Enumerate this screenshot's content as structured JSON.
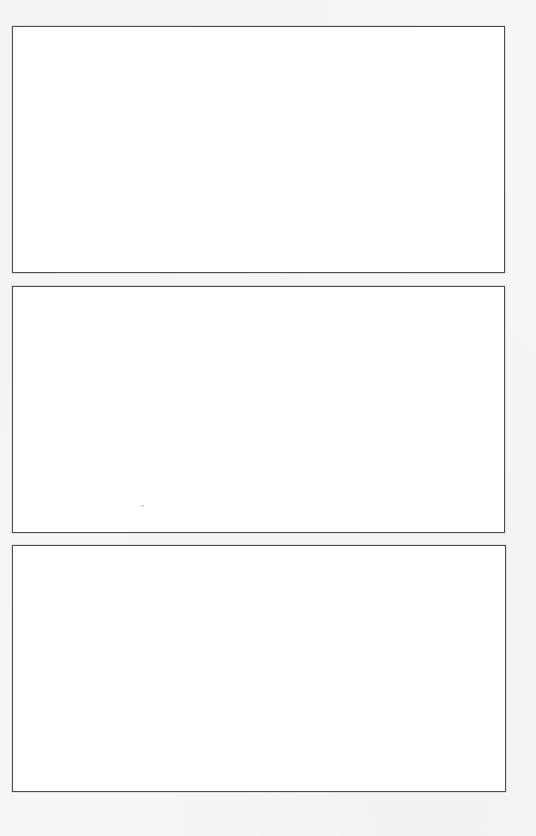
{
  "page": {
    "type": "blank-panel-template",
    "background_color": "#f7f7f7",
    "panel_fill_color": "#ffffff",
    "panel_border_color": "#4d4d4d",
    "panel_count": 3
  },
  "panels": [
    {
      "label": ""
    },
    {
      "label": ""
    },
    {
      "label": ""
    }
  ]
}
